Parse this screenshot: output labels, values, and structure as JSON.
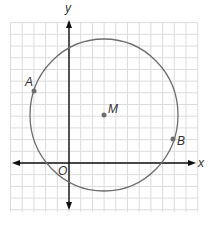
{
  "figure": {
    "type": "coordinate-plane-circle",
    "axes": {
      "x_label": "x",
      "y_label": "y",
      "origin_label": "O"
    },
    "grid": {
      "unit_px": 11.7,
      "x_range": [
        -5,
        11
      ],
      "y_range": [
        -4,
        12
      ]
    },
    "circle": {
      "center_label": "M",
      "center": [
        3,
        4
      ],
      "radius_units": 6.4
    },
    "points": [
      {
        "label": "A",
        "coords": [
          -3,
          6
        ]
      },
      {
        "label": "B",
        "coords": [
          9,
          2
        ]
      },
      {
        "label": "M",
        "coords": [
          3,
          4
        ]
      }
    ],
    "colors": {
      "grid": "#d9d9d9",
      "axis": "#111111",
      "circle": "#6e6e6e",
      "point": "#6e6e6e"
    }
  }
}
